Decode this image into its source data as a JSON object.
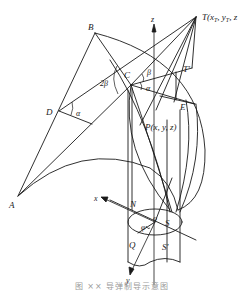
{
  "figure": {
    "points": {
      "A": {
        "label": "A",
        "x": 18,
        "y": 196
      },
      "B": {
        "label": "B",
        "x": 95,
        "y": 33
      },
      "C": {
        "label": "C",
        "x": 131,
        "y": 85
      },
      "D": {
        "label": "D",
        "x": 59,
        "y": 111
      },
      "T": {
        "label": "T(x",
        "x": 196,
        "y": 17
      },
      "T_sub": "T",
      "T_rest": ", y",
      "T_end": ", z",
      "Tprime": {
        "label": "T'",
        "x": 192,
        "y": 68
      },
      "E": {
        "label": "E",
        "x": 195,
        "y": 104
      },
      "P": {
        "label": "P(x, y, z)",
        "x": 140,
        "y": 125
      },
      "N": {
        "label": "N",
        "x": 133,
        "y": 205
      },
      "Q": {
        "label": "Q",
        "x": 138,
        "y": 240
      },
      "O": {
        "label": "o",
        "x": 155,
        "y": 222
      },
      "S": {
        "label": "S",
        "x": 167,
        "y": 222
      },
      "Sprime": {
        "label": "S'",
        "x": 167,
        "y": 245
      }
    },
    "angles": {
      "alpha_D": "α",
      "alpha_C": "α",
      "beta_C": "β",
      "two_beta": "2β",
      "phi": "φ"
    },
    "axes": {
      "x": "x",
      "y": "y",
      "z": "z"
    },
    "colors": {
      "line": "#1a1a1a",
      "background": "#ffffff",
      "caption": "#9a9a9a"
    }
  },
  "caption": "图 ×× 导弹制导示意图"
}
